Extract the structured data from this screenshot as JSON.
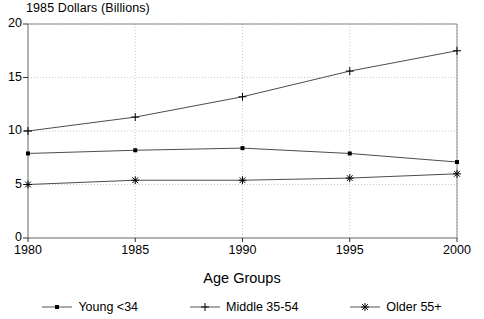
{
  "chart_data": {
    "type": "line",
    "title": "",
    "ylabel": "1985 Dollars (Billions)",
    "xlabel": "Age Groups",
    "x": [
      1980,
      1985,
      1990,
      1995,
      2000
    ],
    "xtick_labels": [
      "1980",
      "1985",
      "1990",
      "1995",
      "2000"
    ],
    "ytick_labels": [
      "0",
      "5",
      "10",
      "15",
      "20"
    ],
    "yticks": [
      0,
      5,
      10,
      15,
      20
    ],
    "ylim": [
      0,
      20
    ],
    "xlim": [
      1980,
      2000
    ],
    "grid": true,
    "grid_style": "dotted",
    "legend_position": "bottom",
    "series": [
      {
        "name": "Young <34",
        "marker": "dot",
        "color": "#4d4d4d",
        "values": [
          7.9,
          8.2,
          8.4,
          7.9,
          7.1
        ]
      },
      {
        "name": "Middle 35-54",
        "marker": "plus",
        "color": "#4d4d4d",
        "values": [
          10.0,
          11.3,
          13.2,
          15.6,
          17.5
        ]
      },
      {
        "name": "Older 55+",
        "marker": "asterisk",
        "color": "#4d4d4d",
        "values": [
          5.0,
          5.4,
          5.4,
          5.6,
          6.0
        ]
      }
    ]
  },
  "legend": {
    "items": [
      {
        "label": "Young <34",
        "marker": "dot"
      },
      {
        "label": "Middle 35-54",
        "marker": "plus"
      },
      {
        "label": "Older 55+",
        "marker": "asterisk"
      }
    ]
  },
  "colors": {
    "axis": "#000000",
    "grid": "#c8c8c8",
    "line": "#555555",
    "marker": "#000000",
    "background": "#ffffff"
  }
}
